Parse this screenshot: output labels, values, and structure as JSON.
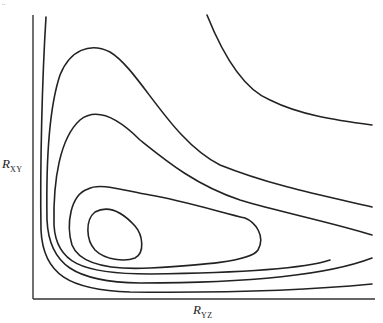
{
  "figure": {
    "page_mark": "..",
    "y_axis": {
      "symbol": "R",
      "subscript": "XY"
    },
    "x_axis": {
      "symbol": "R",
      "subscript": "YZ"
    },
    "line_color": "#222222",
    "background": "#ffffff"
  },
  "contours": [
    {
      "id": "top-right-open",
      "description": "open hyperbola-like contour in upper right"
    },
    {
      "id": "outer-L",
      "description": "outermost L-shaped contour hugging both axes"
    },
    {
      "id": "tongue-large",
      "description": "large tongue contour peaking near top-left"
    },
    {
      "id": "tongue-small",
      "description": "smaller tongue contour"
    },
    {
      "id": "loop-outer",
      "description": "closed loop around the minimum"
    },
    {
      "id": "loop-inner",
      "description": "innermost closed loop (well)"
    }
  ]
}
